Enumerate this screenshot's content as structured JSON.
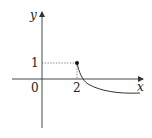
{
  "diagram": {
    "type": "function-graph",
    "axes": {
      "x_label": "x",
      "y_label": "y",
      "origin_label": "0"
    },
    "ticks": {
      "x_tick": "2",
      "y_tick": "1"
    },
    "point": {
      "x": 2,
      "y": 1,
      "filled": true
    },
    "curve": {
      "description": "decreasing concave-up curve starting at (2,1), crossing x-axis, approaching a horizontal asymptote below x-axis"
    },
    "guides": {
      "style": "dotted",
      "from_point_to_axes": true
    },
    "colors": {
      "stroke": "#333333",
      "guide": "#555555"
    }
  }
}
